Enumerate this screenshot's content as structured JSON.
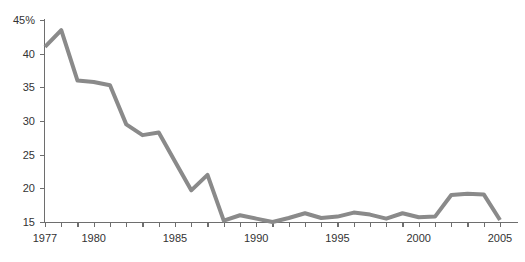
{
  "chart_data": {
    "type": "line",
    "title": "",
    "subtitle": "",
    "xlabel": "",
    "ylabel": "",
    "grid": false,
    "legend": "none",
    "x": [
      1977,
      1978,
      1979,
      1980,
      1981,
      1982,
      1983,
      1984,
      1985,
      1986,
      1987,
      1988,
      1989,
      1990,
      1991,
      1992,
      1993,
      1994,
      1995,
      1996,
      1997,
      1998,
      1999,
      2000,
      2001,
      2002,
      2003,
      2004,
      2005
    ],
    "values": [
      41.0,
      43.5,
      36.0,
      35.8,
      35.3,
      29.5,
      27.9,
      28.3,
      24.0,
      19.7,
      22.0,
      15.2,
      16.0,
      15.5,
      15.0,
      15.6,
      16.3,
      15.6,
      15.8,
      16.4,
      16.1,
      15.5,
      16.3,
      15.7,
      15.8,
      19.0,
      19.2,
      19.1,
      15.3
    ],
    "series": [
      {
        "name": "series-1",
        "color": "#8a8a8a",
        "values": [
          41.0,
          43.5,
          36.0,
          35.8,
          35.3,
          29.5,
          27.9,
          28.3,
          24.0,
          19.7,
          22.0,
          15.2,
          16.0,
          15.5,
          15.0,
          15.6,
          16.3,
          15.6,
          15.8,
          16.4,
          16.1,
          15.5,
          16.3,
          15.7,
          15.8,
          19.0,
          19.2,
          19.1,
          15.3
        ]
      }
    ],
    "xlim": [
      1977,
      2005
    ],
    "ylim": [
      15,
      45
    ],
    "y_ticks": [
      15,
      20,
      25,
      30,
      35,
      40,
      45
    ],
    "y_tick_labels": [
      "15",
      "20",
      "25",
      "30",
      "35",
      "40",
      "45%"
    ],
    "x_ticks": [
      1977,
      1978,
      1979,
      1980,
      1981,
      1982,
      1983,
      1984,
      1985,
      1986,
      1987,
      1988,
      1989,
      1990,
      1991,
      1992,
      1993,
      1994,
      1995,
      1996,
      1997,
      1998,
      1999,
      2000,
      2001,
      2002,
      2003,
      2004,
      2005
    ],
    "x_tick_labels": [
      {
        "value": 1977,
        "label": "1977"
      },
      {
        "value": 1980,
        "label": "1980"
      },
      {
        "value": 1985,
        "label": "1985"
      },
      {
        "value": 1990,
        "label": "1990"
      },
      {
        "value": 1995,
        "label": "1995"
      },
      {
        "value": 2000,
        "label": "2000"
      },
      {
        "value": 2005,
        "label": "2005"
      }
    ],
    "colors": {
      "line": "#8a8a8a",
      "axis": "#6e6e6e",
      "text": "#333333",
      "background": "#ffffff"
    }
  }
}
